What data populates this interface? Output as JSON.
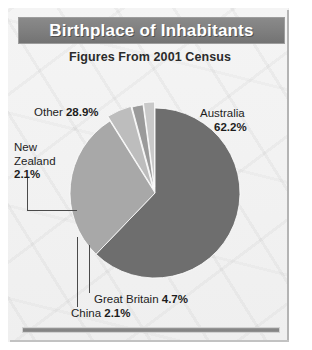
{
  "header": {
    "title": "Birthplace of Inhabitants",
    "subtitle": "Figures From 2001 Census"
  },
  "labels": {
    "other_name": "Other ",
    "other_pct": "28.9%",
    "nz_name": "New Zealand ",
    "nz_pct": "2.1%",
    "australia_name": "Australia",
    "australia_pct": "62.2%",
    "gb_name": "Great Britain ",
    "gb_pct": "4.7%",
    "china_name": "China ",
    "china_pct": "2.1%"
  },
  "colors": {
    "banner": "#7e7e7e",
    "slice_major": "#6e6e6e",
    "slice_minor": "#a8a8a8",
    "slice_thin": "#bdbdbd",
    "background": "#f2f2f2",
    "text": "#1d1d1d",
    "title_text": "#ffffff"
  },
  "chart_data": {
    "type": "pie",
    "title": "Birthplace of Inhabitants",
    "subtitle": "Figures From 2001 Census",
    "unit": "%",
    "start_angle_deg": 0,
    "direction": "clockwise",
    "center": [
      155,
      193
    ],
    "radius": 85,
    "legend": "labels-with-leader-lines",
    "grid": false,
    "categories": [
      "Australia",
      "Other",
      "Great Britain",
      "China",
      "New Zealand"
    ],
    "values": [
      62.2,
      28.9,
      4.7,
      2.1,
      2.1
    ],
    "slices": [
      {
        "label": "Australia",
        "value": 62.2,
        "color": "#6e6e6e",
        "display": "62.2%"
      },
      {
        "label": "Other",
        "value": 28.9,
        "color": "#a8a8a8",
        "display": "28.9%"
      },
      {
        "label": "Great Britain",
        "value": 4.7,
        "color": "#bdbdbd",
        "display": "4.7%"
      },
      {
        "label": "China",
        "value": 2.1,
        "color": "#9a9a9a",
        "display": "2.1%"
      },
      {
        "label": "New Zealand",
        "value": 2.1,
        "color": "#c9c9c9",
        "display": "2.1%"
      }
    ]
  }
}
